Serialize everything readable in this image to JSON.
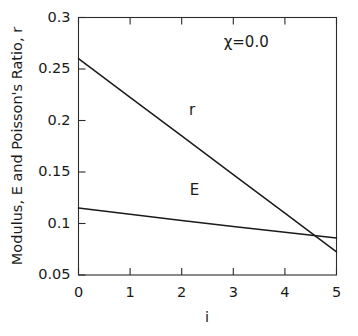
{
  "chart_data": {
    "type": "line",
    "title": "",
    "subtitle": "",
    "xlabel": "i",
    "ylabel": "Modulus, E and Poisson's Ratio, r",
    "xlim": [
      0,
      5
    ],
    "ylim": [
      0.05,
      0.3
    ],
    "grid": false,
    "legend_position": "inline-curve-labels",
    "x_ticks": [
      "0",
      "1",
      "2",
      "3",
      "4",
      "5"
    ],
    "x_tick_values": [
      0,
      1,
      2,
      3,
      4,
      5
    ],
    "y_ticks": [
      "0.05",
      "0.1",
      "0.15",
      "0.2",
      "0.25",
      "0.3"
    ],
    "y_tick_values": [
      0.05,
      0.1,
      0.15,
      0.2,
      0.25,
      0.3
    ],
    "x": [
      0,
      1,
      2,
      3,
      4,
      5
    ],
    "series": [
      {
        "name": "r",
        "label": "r",
        "color": "#1a1a1a",
        "values": [
          0.26,
          0.2225,
          0.185,
          0.1475,
          0.11,
          0.0725
        ],
        "label_point": {
          "x": 2.2,
          "y": 0.205
        }
      },
      {
        "name": "E",
        "label": "E",
        "color": "#1a1a1a",
        "values": [
          0.115,
          0.109,
          0.103,
          0.097,
          0.0915,
          0.086
        ],
        "label_point": {
          "x": 2.25,
          "y": 0.128
        }
      }
    ],
    "annotations": [
      {
        "name": "chi-value",
        "text": "χ=0.0",
        "x": 3.25,
        "y": 0.2715
      }
    ]
  },
  "axes": {
    "x_axis_label": "i",
    "y_axis_label": "Modulus, E and Poisson's Ratio, r"
  }
}
